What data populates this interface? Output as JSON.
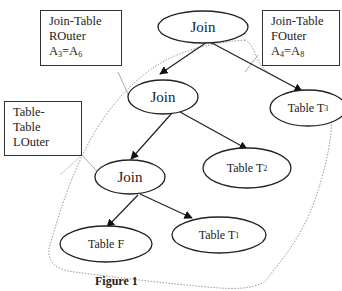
{
  "diagram": {
    "labels": {
      "rightouter": {
        "lines": [
          "Join-Table",
          "ROuter"
        ],
        "eq_left": "A",
        "eq_left_sub": "3",
        "eq_right": "A",
        "eq_right_sub": "6"
      },
      "fullouter": {
        "lines": [
          "Join-Table",
          "FOuter"
        ],
        "eq_left": "A",
        "eq_left_sub": "4",
        "eq_right": "A",
        "eq_right_sub": "8"
      },
      "leftouter": {
        "lines": [
          "Table-",
          "Table",
          "LOuter"
        ]
      }
    },
    "nodes": {
      "join_top": "Join",
      "join_mid": "Join",
      "join_low": "Join",
      "table_t3": {
        "text": "Table T",
        "sub": "3"
      },
      "table_t2": {
        "text": "Table T",
        "sub": "2"
      },
      "table_t1": {
        "text": "Table T",
        "sub": "1"
      },
      "table_f": {
        "text": "Table F"
      }
    },
    "edges": [
      [
        "join_top",
        "join_mid"
      ],
      [
        "join_top",
        "table_t3"
      ],
      [
        "join_mid",
        "join_low"
      ],
      [
        "join_mid",
        "table_t2"
      ],
      [
        "join_low",
        "table_f"
      ],
      [
        "join_low",
        "table_t1"
      ]
    ],
    "caption": "Figure 1",
    "colors": {
      "stroke": "#222222",
      "dotted_outline": "#9a9a9a",
      "pointer": "#aaaaaa"
    }
  }
}
